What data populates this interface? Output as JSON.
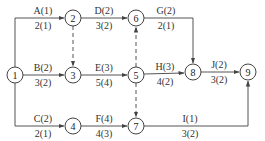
{
  "diagram": {
    "type": "activity-on-arrow network",
    "nodes": [
      {
        "id": "1",
        "label": "1",
        "x": 15,
        "y": 75
      },
      {
        "id": "2",
        "label": "2",
        "x": 73,
        "y": 18
      },
      {
        "id": "3",
        "label": "3",
        "x": 73,
        "y": 75
      },
      {
        "id": "4",
        "label": "4",
        "x": 73,
        "y": 126
      },
      {
        "id": "5",
        "label": "5",
        "x": 136,
        "y": 75
      },
      {
        "id": "6",
        "label": "6",
        "x": 136,
        "y": 18
      },
      {
        "id": "7",
        "label": "7",
        "x": 136,
        "y": 126
      },
      {
        "id": "8",
        "label": "8",
        "x": 193,
        "y": 72
      },
      {
        "id": "9",
        "label": "9",
        "x": 248,
        "y": 72
      }
    ],
    "activities": [
      {
        "name": "A",
        "from": "1",
        "to": "2",
        "top": "A(1)",
        "bottom": "2(1)"
      },
      {
        "name": "B",
        "from": "1",
        "to": "3",
        "top": "B(2)",
        "bottom": "3(2)"
      },
      {
        "name": "C",
        "from": "1",
        "to": "4",
        "top": "C(2)",
        "bottom": "2(1)"
      },
      {
        "name": "D",
        "from": "2",
        "to": "6",
        "top": "D(2)",
        "bottom": "3(2)"
      },
      {
        "name": "E",
        "from": "3",
        "to": "5",
        "top": "E(3)",
        "bottom": "5(4)"
      },
      {
        "name": "F",
        "from": "4",
        "to": "7",
        "top": "F(4)",
        "bottom": "4(3)"
      },
      {
        "name": "G",
        "from": "6",
        "to": "8",
        "top": "G(2)",
        "bottom": "2(1)"
      },
      {
        "name": "H",
        "from": "5",
        "to": "8",
        "top": "H(3)",
        "bottom": "4(2)"
      },
      {
        "name": "I",
        "from": "7",
        "to": "9",
        "top": "I(1)",
        "bottom": "3(2)"
      },
      {
        "name": "J",
        "from": "8",
        "to": "9",
        "top": "J(2)",
        "bottom": "3(2)"
      }
    ],
    "dummies": [
      {
        "from": "2",
        "to": "3"
      },
      {
        "from": "5",
        "to": "6"
      },
      {
        "from": "5",
        "to": "7"
      }
    ],
    "colors": {
      "line": "#444444",
      "text": "#333333",
      "background": "#ffffff"
    }
  }
}
